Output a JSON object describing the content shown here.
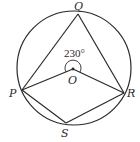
{
  "diagram": {
    "type": "circle-geometry",
    "circle": {
      "center_label": "O"
    },
    "points": [
      {
        "id": "Q",
        "label": "Q"
      },
      {
        "id": "P",
        "label": "P"
      },
      {
        "id": "R",
        "label": "R"
      },
      {
        "id": "S",
        "label": "S"
      },
      {
        "id": "O",
        "label": "O"
      }
    ],
    "angle_label": "230°",
    "segments": [
      "QP",
      "QR",
      "PO",
      "OR",
      "PS",
      "SR"
    ],
    "colors": {
      "stroke": "#2a2a2a",
      "background": "#ffffff"
    }
  }
}
